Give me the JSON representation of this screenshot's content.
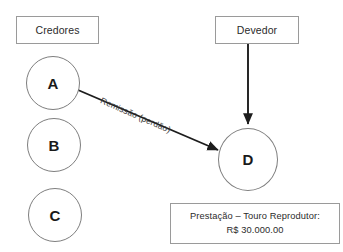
{
  "diagram": {
    "title_boxes": {
      "creditors_group_label": "Credores",
      "debtor_group_label": "Devedor"
    },
    "creditor_nodes": [
      {
        "label": "A"
      },
      {
        "label": "B"
      },
      {
        "label": "C"
      }
    ],
    "debtor_node": {
      "label": "D"
    },
    "edges": [
      {
        "name": "remissao-edge",
        "label": "Remissão (perdão)",
        "from": "A",
        "to": "D"
      },
      {
        "name": "devedor-edge",
        "label": "",
        "from": "Devedor",
        "to": "D"
      }
    ],
    "note_box": {
      "line1": "Prestação – Touro Reprodutor:",
      "line2": "R$ 30.000.00"
    },
    "colors": {
      "background": "#ffffff",
      "box_border": "#9a9a9a",
      "circle_border": "#7e7e7e",
      "arrow": "#1d1d1d",
      "text": "#2b2b2b"
    }
  }
}
